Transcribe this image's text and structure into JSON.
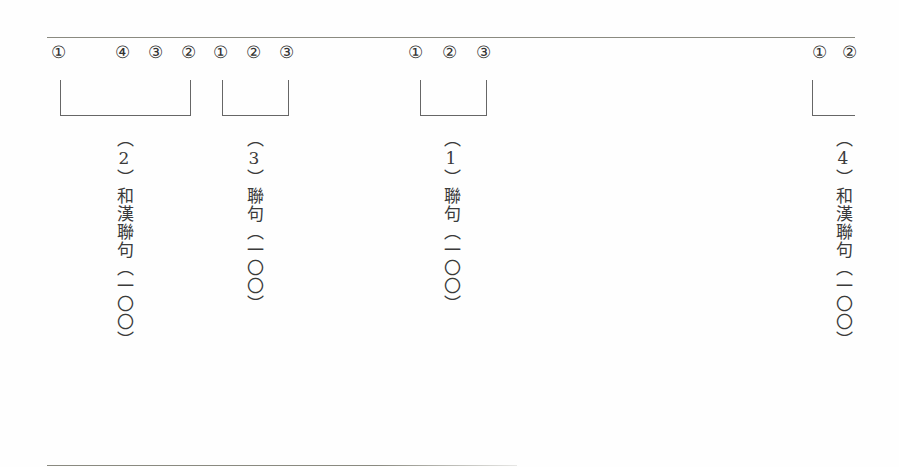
{
  "markers": {
    "group_a": [
      "①",
      "④",
      "③",
      "②"
    ],
    "group_b": [
      "①",
      "②",
      "③"
    ],
    "group_c": [
      "①",
      "②",
      "③"
    ],
    "group_d": [
      "①",
      "②"
    ]
  },
  "labels": {
    "col_2": {
      "open": "︵",
      "num": "2",
      "close": "︶",
      "title": "和漢聯句",
      "count": "︵一〇〇︶"
    },
    "col_3": {
      "open": "︵",
      "num": "3",
      "close": "︶",
      "title": "聯句",
      "count": "︵一〇〇︶"
    },
    "col_1": {
      "open": "︵",
      "num": "1",
      "close": "︶",
      "title": "聯句",
      "count": "︵一〇〇︶"
    },
    "col_4": {
      "open": "︵",
      "num": "4",
      "close": "︶",
      "title": "和漢聯句",
      "count": "︵一〇〇︶"
    }
  }
}
